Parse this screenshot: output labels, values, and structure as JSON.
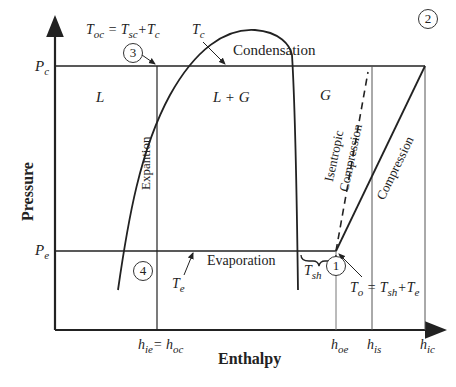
{
  "axes": {
    "x_label": "Enthalpy",
    "y_label": "Pressure",
    "y_ticks": [
      {
        "label": "P",
        "sub": "c",
        "id": "condenser-pressure"
      },
      {
        "label": "P",
        "sub": "e",
        "id": "evaporator-pressure"
      }
    ],
    "x_ticks": [
      {
        "label": "h",
        "sub": "ie",
        "eq": "= h",
        "sub2": "oc"
      },
      {
        "label": "h",
        "sub": "oe"
      },
      {
        "label": "h",
        "sub": "is"
      },
      {
        "label": "h",
        "sub": "ic"
      }
    ]
  },
  "regions": {
    "liquid": "L",
    "mixture": "L + G",
    "gas": "G"
  },
  "processes": {
    "condensation": "Condensation",
    "evaporation": "Evaporation",
    "expansion": "Expantion",
    "compression": "Compression",
    "isentropic_1": "Isentropic",
    "isentropic_2": "Compression"
  },
  "states": [
    "1",
    "2",
    "3",
    "4"
  ],
  "annotations": {
    "t_oc": {
      "T": "T",
      "sub": "oc",
      "eq": " = T",
      "sub2": "sc",
      "plus": "+T",
      "sub3": "c"
    },
    "t_c": {
      "T": "T",
      "sub": "c"
    },
    "t_e": {
      "T": "T",
      "sub": "e"
    },
    "t_sh": {
      "T": "T",
      "sub": "sh"
    },
    "t_o": {
      "T": "T",
      "sub": "o",
      "eq": " = T",
      "sub2": "sh",
      "plus": "+T",
      "sub3": "e"
    }
  },
  "colors": {
    "line": "#222222",
    "background": "#ffffff"
  }
}
